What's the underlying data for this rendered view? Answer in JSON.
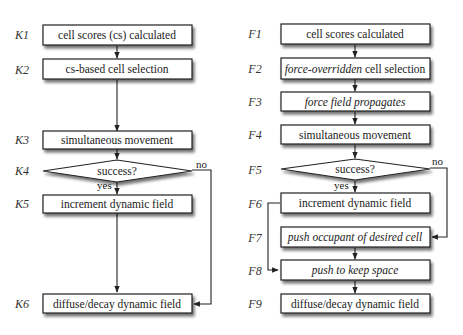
{
  "left_flow": {
    "steps": [
      {
        "id": "K1",
        "text": "cell scores (cs) calculated"
      },
      {
        "id": "K2",
        "text": "cs-based cell selection"
      },
      {
        "id": "K3",
        "text": "simultaneous movement"
      },
      {
        "id": "K4",
        "text": "success?"
      },
      {
        "id": "K5",
        "text": "increment dynamic field"
      },
      {
        "id": "K6",
        "text": "diffuse/decay dynamic field"
      }
    ],
    "yes_label": "yes",
    "no_label": "no"
  },
  "right_flow": {
    "steps": [
      {
        "id": "F1",
        "text": "cell scores calculated"
      },
      {
        "id": "F2",
        "text_italic": "force-overridden",
        "text": " cell selection"
      },
      {
        "id": "F3",
        "text": "force field propagates"
      },
      {
        "id": "F4",
        "text": "simultaneous movement"
      },
      {
        "id": "F5",
        "text": "success?"
      },
      {
        "id": "F6",
        "text": "increment dynamic field"
      },
      {
        "id": "F7",
        "text": "push occupant of desired cell"
      },
      {
        "id": "F8",
        "text": "push to keep space"
      },
      {
        "id": "F9",
        "text": "diffuse/decay dynamic field"
      }
    ],
    "yes_label": "yes",
    "no_label": "no"
  }
}
